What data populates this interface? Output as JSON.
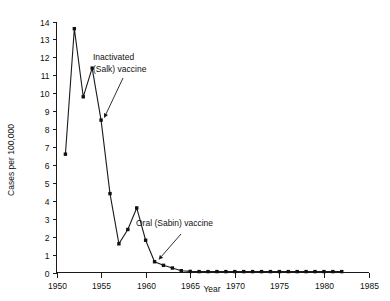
{
  "chart_data": {
    "type": "line",
    "title": "",
    "xlabel": "Year",
    "ylabel": "Cases per 100,000",
    "xlim": [
      1950,
      1985
    ],
    "ylim": [
      0,
      14
    ],
    "grid": false,
    "legend": "none",
    "x_ticks": [
      1950,
      1955,
      1960,
      1965,
      1970,
      1975,
      1980,
      1985
    ],
    "x_tick_labels": [
      "1950",
      "1955",
      "1960",
      "1965",
      "1970",
      "1975",
      "1980",
      "1985"
    ],
    "y_ticks": [
      0,
      1,
      2,
      3,
      4,
      5,
      6,
      7,
      8,
      9,
      10,
      11,
      12,
      13,
      14
    ],
    "y_tick_labels": [
      "0",
      "1",
      "2",
      "3",
      "4",
      "5",
      "6",
      "7",
      "8",
      "9",
      "10",
      "11",
      "12",
      "13",
      "14"
    ],
    "x": [
      1951,
      1952,
      1953,
      1954,
      1955,
      1956,
      1957,
      1958,
      1959,
      1960,
      1961,
      1962,
      1963,
      1964,
      1965,
      1966,
      1967,
      1968,
      1969,
      1970,
      1971,
      1972,
      1973,
      1974,
      1975,
      1976,
      1977,
      1978,
      1979,
      1980,
      1981,
      1982
    ],
    "values": [
      6.6,
      13.6,
      9.8,
      11.4,
      8.5,
      4.4,
      1.6,
      2.4,
      3.6,
      1.8,
      0.6,
      0.4,
      0.25,
      0.1,
      0.06,
      0.05,
      0.05,
      0.05,
      0.05,
      0.05,
      0.05,
      0.05,
      0.05,
      0.05,
      0.05,
      0.05,
      0.05,
      0.05,
      0.05,
      0.05,
      0.05,
      0.05
    ],
    "series": [
      {
        "name": "Poliomyelitis incidence",
        "values": [
          6.6,
          13.6,
          9.8,
          11.4,
          8.5,
          4.4,
          1.6,
          2.4,
          3.6,
          1.8,
          0.6,
          0.4,
          0.25,
          0.1,
          0.06,
          0.05,
          0.05,
          0.05,
          0.05,
          0.05,
          0.05,
          0.05,
          0.05,
          0.05,
          0.05,
          0.05,
          0.05,
          0.05,
          0.05,
          0.05,
          0.05,
          0.05
        ]
      }
    ],
    "annotations": [
      {
        "id": "salk",
        "line1": "Inactivated",
        "line2": "(Salk) vaccine",
        "points_to_x": 1955,
        "points_to_y": 8.5
      },
      {
        "id": "sabin",
        "line1": "Oral (Sabin) vaccine",
        "line2": "",
        "points_to_x": 1961,
        "points_to_y": 0.6
      }
    ],
    "colors": {
      "line": "#1a1a1a",
      "marker": "#111111",
      "axis": "#1a1a1a",
      "background": "#ffffff"
    }
  }
}
